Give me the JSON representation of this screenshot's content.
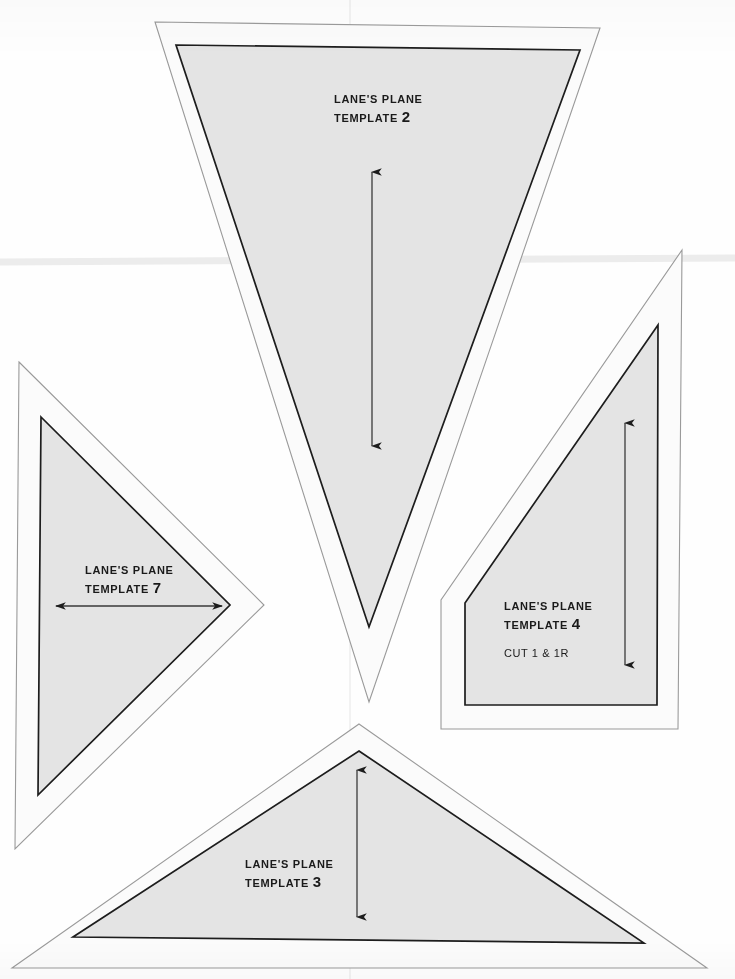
{
  "document": {
    "kind": "scanned-pattern-sheet",
    "page_background": "#fefefe",
    "piece_fill": "#e4e4e4",
    "seam_allowance_fill": "#fbfbfb",
    "line_color": "#1d1d1d",
    "faint_line_color": "#8d8d8d"
  },
  "templates": [
    {
      "id": "template-2",
      "brand": "LANE'S PLANE",
      "template_word": "TEMPLATE",
      "number": "2",
      "cut_note": "",
      "grainline": {
        "direction": "vertical",
        "arrowheads": "both"
      }
    },
    {
      "id": "template-7",
      "brand": "LANE'S PLANE",
      "template_word": "TEMPLATE",
      "number": "7",
      "cut_note": "",
      "grainline": {
        "direction": "horizontal",
        "arrowheads": "both"
      }
    },
    {
      "id": "template-4",
      "brand": "LANE'S PLANE",
      "template_word": "TEMPLATE",
      "number": "4",
      "cut_note": "CUT 1 & 1R",
      "grainline": {
        "direction": "vertical",
        "arrowheads": "both"
      }
    },
    {
      "id": "template-3",
      "brand": "LANE'S PLANE",
      "template_word": "TEMPLATE",
      "number": "3",
      "cut_note": "",
      "grainline": {
        "direction": "vertical",
        "arrowheads": "both"
      }
    }
  ],
  "geometry": {
    "template_2": {
      "outer": "155,22 600,28 369,702",
      "inner": "176,45 580,50 369,627"
    },
    "template_7": {
      "outer": "19,362 264,605 15,849",
      "inner": "41,417 230,605 38,795"
    },
    "template_4": {
      "outer": "682,250 678,729 441,729 441,600",
      "inner": "658,325 657,705 465,705 465,603"
    },
    "template_3": {
      "outer": "359,724 707,968 12,968",
      "inner": "359,751 644,943 73,937"
    },
    "grainlines": {
      "template_2": {
        "x": 372,
        "y1": 172,
        "y2": 446
      },
      "template_7": {
        "y": 606,
        "x1": 56,
        "x2": 222
      },
      "template_4": {
        "x": 625,
        "y1": 423,
        "y2": 665
      },
      "template_3": {
        "x": 357,
        "y1": 770,
        "y2": 917
      }
    },
    "fold_line_y": 262
  }
}
